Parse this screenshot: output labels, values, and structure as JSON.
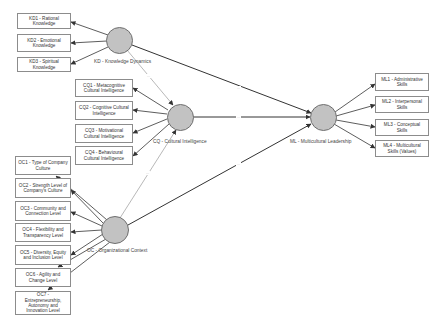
{
  "diagram": {
    "type": "structural-equation-model",
    "constructs": [
      {
        "id": "KD",
        "label": "KD - Knowledge Dynamics"
      },
      {
        "id": "CQ",
        "label": "CQ - Cultural Intelligence"
      },
      {
        "id": "OC",
        "label": "OC - Organizational Context"
      },
      {
        "id": "ML",
        "label": "ML - Multicultural Leadership"
      }
    ],
    "indicators": {
      "KD": [
        "KD1 - Rational Knowledge",
        "KD2 - Emotional Knowledge",
        "KD3 - Spiritual Knowledge"
      ],
      "CQ": [
        "CQ1 - Metacognitive Cultural Intelligence",
        "CQ2 - Cognitive Cultural Intelligence",
        "CQ3 - Motivational Cultural Intelligence",
        "CQ4 - Behavioural Cultural Intelligence"
      ],
      "OC": [
        "OC1 - Type of Company Culture",
        "OC2 - Strength Level of Company's Culture",
        "OC3 - Community and Connection Level",
        "OC4 - Flexibility and Transparency Level",
        "OC5 - Diversity, Equity and Inclusion Level",
        "OC6 - Agility and Change Level",
        "OC7 - Entrepreneurship, Autonomy and Innovation Level"
      ],
      "ML": [
        "ML1 - Administrative Skills",
        "ML2 - Interpersonal Skills",
        "ML3 - Conceptual Skills",
        "ML4 - Multicultural Skills (Values)"
      ]
    },
    "paths": [
      {
        "from": "KD",
        "to": "CQ",
        "label": "..."
      },
      {
        "from": "KD",
        "to": "ML",
        "label": "..."
      },
      {
        "from": "CQ",
        "to": "ML",
        "label": "..."
      },
      {
        "from": "OC",
        "to": "CQ",
        "label": "..."
      },
      {
        "from": "OC",
        "to": "ML",
        "label": "..."
      }
    ],
    "colors": {
      "construct_fill": "#c2c2c2",
      "construct_border": "#6f6f6f",
      "box_border": "#8c8c8c",
      "line": "#333333"
    }
  }
}
